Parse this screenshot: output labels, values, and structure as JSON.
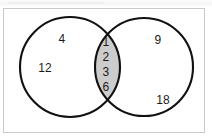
{
  "figure": {
    "kind": "venn-diagram",
    "set_count": 2,
    "frame_color": "#c9c9c9",
    "background_color": "#ffffff",
    "outline_color": "#111111",
    "shaded_region": "intersection",
    "shade_color": "#cccccc"
  },
  "regions": {
    "left_only": {
      "name": "left-circle-only",
      "values": [
        "4",
        "12"
      ]
    },
    "intersection": {
      "name": "intersection",
      "shaded": "true",
      "values": [
        "1",
        "2",
        "3",
        "6"
      ]
    },
    "right_only": {
      "name": "right-circle-only",
      "values": [
        "9",
        "18"
      ]
    }
  }
}
